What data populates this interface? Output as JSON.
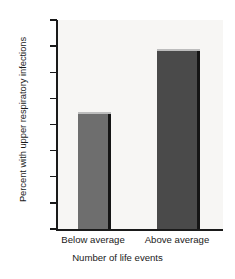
{
  "chart_data": {
    "type": "bar",
    "title": "",
    "categories": [
      "Below average",
      "Above average"
    ],
    "values": [
      22,
      34
    ],
    "xlabel": "Number of life events",
    "ylabel": "Percent with upper respiratory infections",
    "ylim": [
      0,
      40
    ],
    "yticks": [
      0,
      5,
      10,
      15,
      20,
      25,
      30,
      35,
      40
    ],
    "ytick_labels": [
      "0",
      "5",
      "10",
      "15",
      "20",
      "25",
      "30",
      "35",
      "40"
    ],
    "grid": false,
    "legend": null,
    "bar_colors": [
      "#6e6e6e",
      "#4a4a4a"
    ],
    "background_color": "#f7f6f4",
    "axis_color": "#1a1a1a"
  }
}
